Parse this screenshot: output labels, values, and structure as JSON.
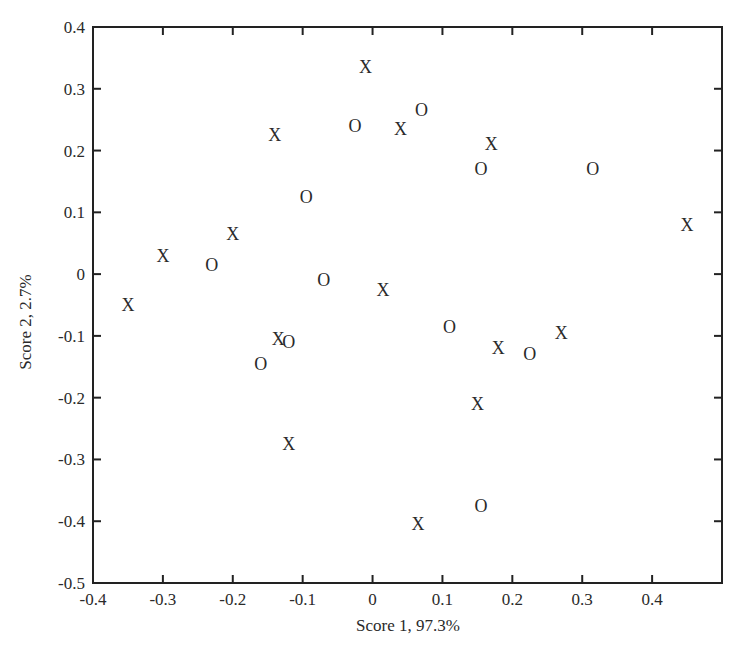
{
  "chart_data": {
    "type": "scatter",
    "title": "",
    "xlabel": "Score 1,  97.3%",
    "ylabel": "Score 2,  2.7%",
    "xlim": [
      -0.4,
      0.5
    ],
    "ylim": [
      -0.5,
      0.4
    ],
    "grid": false,
    "legend": null,
    "xticks": [
      "-0.4",
      "-0.3",
      "-0.2",
      "-0.1",
      "0",
      "0.1",
      "0.2",
      "0.3",
      "0.4"
    ],
    "xtick_values": [
      -0.4,
      -0.3,
      -0.2,
      -0.1,
      0,
      0.1,
      0.2,
      0.3,
      0.4
    ],
    "yticks": [
      "0.4",
      "0.3",
      "0.2",
      "0.1",
      "0",
      "-0.1",
      "-0.2",
      "-0.3",
      "-0.4",
      "-0.5"
    ],
    "ytick_values": [
      0.4,
      0.3,
      0.2,
      0.1,
      0,
      -0.1,
      -0.2,
      -0.3,
      -0.4,
      -0.5
    ],
    "series": [
      {
        "name": "X",
        "marker": "X",
        "points": [
          {
            "x": -0.35,
            "y": -0.05
          },
          {
            "x": -0.3,
            "y": 0.03
          },
          {
            "x": -0.2,
            "y": 0.065
          },
          {
            "x": -0.14,
            "y": 0.225
          },
          {
            "x": -0.01,
            "y": 0.335
          },
          {
            "x": 0.04,
            "y": 0.235
          },
          {
            "x": 0.17,
            "y": 0.21
          },
          {
            "x": 0.45,
            "y": 0.08
          },
          {
            "x": 0.015,
            "y": -0.025
          },
          {
            "x": -0.135,
            "y": -0.105
          },
          {
            "x": 0.18,
            "y": -0.12
          },
          {
            "x": 0.27,
            "y": -0.095
          },
          {
            "x": 0.15,
            "y": -0.21
          },
          {
            "x": -0.12,
            "y": -0.275
          },
          {
            "x": 0.065,
            "y": -0.405
          }
        ]
      },
      {
        "name": "O",
        "marker": "O",
        "points": [
          {
            "x": -0.23,
            "y": 0.015
          },
          {
            "x": -0.095,
            "y": 0.125
          },
          {
            "x": -0.025,
            "y": 0.24
          },
          {
            "x": 0.07,
            "y": 0.265
          },
          {
            "x": 0.155,
            "y": 0.17
          },
          {
            "x": 0.315,
            "y": 0.17
          },
          {
            "x": -0.07,
            "y": -0.01
          },
          {
            "x": -0.12,
            "y": -0.11
          },
          {
            "x": -0.16,
            "y": -0.145
          },
          {
            "x": 0.11,
            "y": -0.085
          },
          {
            "x": 0.225,
            "y": -0.13
          },
          {
            "x": 0.155,
            "y": -0.375
          }
        ]
      }
    ]
  },
  "colors": {
    "axis": "#222222",
    "text": "#2a2a2a",
    "background": "#ffffff"
  }
}
